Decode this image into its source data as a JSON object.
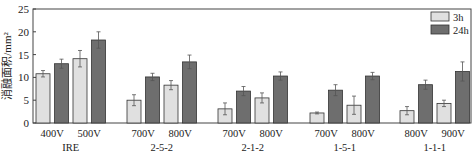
{
  "chart_data": {
    "type": "bar",
    "title": "",
    "xlabel": "",
    "ylabel": "消融面积/mm²",
    "ylim": [
      0,
      25
    ],
    "yticks": [
      0,
      5,
      10,
      15,
      20,
      25
    ],
    "grid": false,
    "legend_position": "top-right",
    "groups": [
      {
        "name": "IRE",
        "categories": [
          "400V",
          "500V"
        ]
      },
      {
        "name": "2-5-2",
        "categories": [
          "700V",
          "800V"
        ]
      },
      {
        "name": "2-1-2",
        "categories": [
          "700V",
          "800V"
        ]
      },
      {
        "name": "1-5-1",
        "categories": [
          "700V",
          "800V"
        ]
      },
      {
        "name": "1-1-1",
        "categories": [
          "800V",
          "900V"
        ]
      }
    ],
    "categories": [
      "IRE 400V",
      "IRE 500V",
      "2-5-2 700V",
      "2-5-2 800V",
      "2-1-2 700V",
      "2-1-2 800V",
      "1-5-1 700V",
      "1-5-1 800V",
      "1-1-1 800V",
      "1-1-1 900V"
    ],
    "series": [
      {
        "name": "3h",
        "color": "#e0e0e0",
        "values": [
          10.8,
          14.1,
          5.0,
          8.3,
          3.1,
          5.5,
          2.2,
          3.9,
          2.7,
          4.3
        ],
        "errors": [
          0.7,
          1.8,
          1.2,
          1.0,
          1.3,
          1.1,
          0.2,
          2.0,
          0.9,
          0.7
        ]
      },
      {
        "name": "24h",
        "color": "#6e6e6e",
        "values": [
          13.0,
          18.2,
          10.1,
          13.4,
          7.0,
          10.3,
          7.2,
          10.3,
          8.4,
          11.3
        ],
        "errors": [
          1.0,
          1.8,
          0.8,
          1.5,
          1.0,
          0.9,
          1.2,
          0.8,
          1.0,
          2.1
        ]
      }
    ]
  },
  "ui": {
    "ylabel": "消融面积/mm²"
  }
}
